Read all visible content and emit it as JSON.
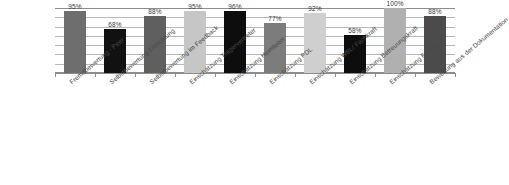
{
  "chart_data": {
    "type": "bar",
    "title": "",
    "subtitle": "",
    "xlabel": "",
    "ylabel": "",
    "ylim": [
      0,
      100
    ],
    "grid": true,
    "legend": "none",
    "gridline_count": 6,
    "categories": [
      "Fremdbewertung - Peer",
      "Selbstbewertung Einrichtung",
      "Selbstbewertung im Feedback",
      "Einschätzung Trägervertreter",
      "Einschätzung Heimleiter",
      "Einschätzung PDL",
      "Einschätzung WBL/ Fachkraft",
      "Einschätzung Betreuungskraft",
      "Einschätzung Familie",
      "Bewertung aus der Dokumentation"
    ],
    "values": [
      95,
      68,
      88,
      95,
      96,
      77,
      92,
      58,
      100,
      88
    ],
    "data_labels": [
      "95%",
      "68%",
      "88%",
      "95%",
      "96%",
      "77%",
      "92%",
      "58%",
      "100%",
      "88%"
    ],
    "bar_colors": [
      "#6e6e6e",
      "#111111",
      "#5f5f5f",
      "#c6c6c6",
      "#0d0d0d",
      "#7c7c7c",
      "#cfcfcf",
      "#0d0d0d",
      "#b0b0b0",
      "#4b4b4b"
    ],
    "axis_color": "#8d8d8d",
    "gridline_color": "#b9b9b9",
    "label_color": "#3a3a3a"
  }
}
